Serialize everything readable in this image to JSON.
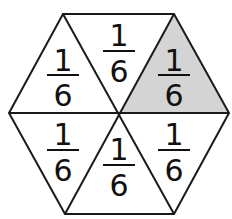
{
  "diagram": {
    "shape": "regular hexagon divided into 6 equal triangles",
    "shaded_color": "#d4d4d4",
    "stroke_color": "#1a1a1a",
    "pieces": [
      {
        "id": "top-left",
        "numerator": "1",
        "denominator": "6",
        "shaded": false
      },
      {
        "id": "top",
        "numerator": "1",
        "denominator": "6",
        "shaded": false
      },
      {
        "id": "top-right",
        "numerator": "1",
        "denominator": "6",
        "shaded": true
      },
      {
        "id": "bottom-right",
        "numerator": "1",
        "denominator": "6",
        "shaded": false
      },
      {
        "id": "bottom",
        "numerator": "1",
        "denominator": "6",
        "shaded": false
      },
      {
        "id": "bottom-left",
        "numerator": "1",
        "denominator": "6",
        "shaded": false
      }
    ]
  }
}
